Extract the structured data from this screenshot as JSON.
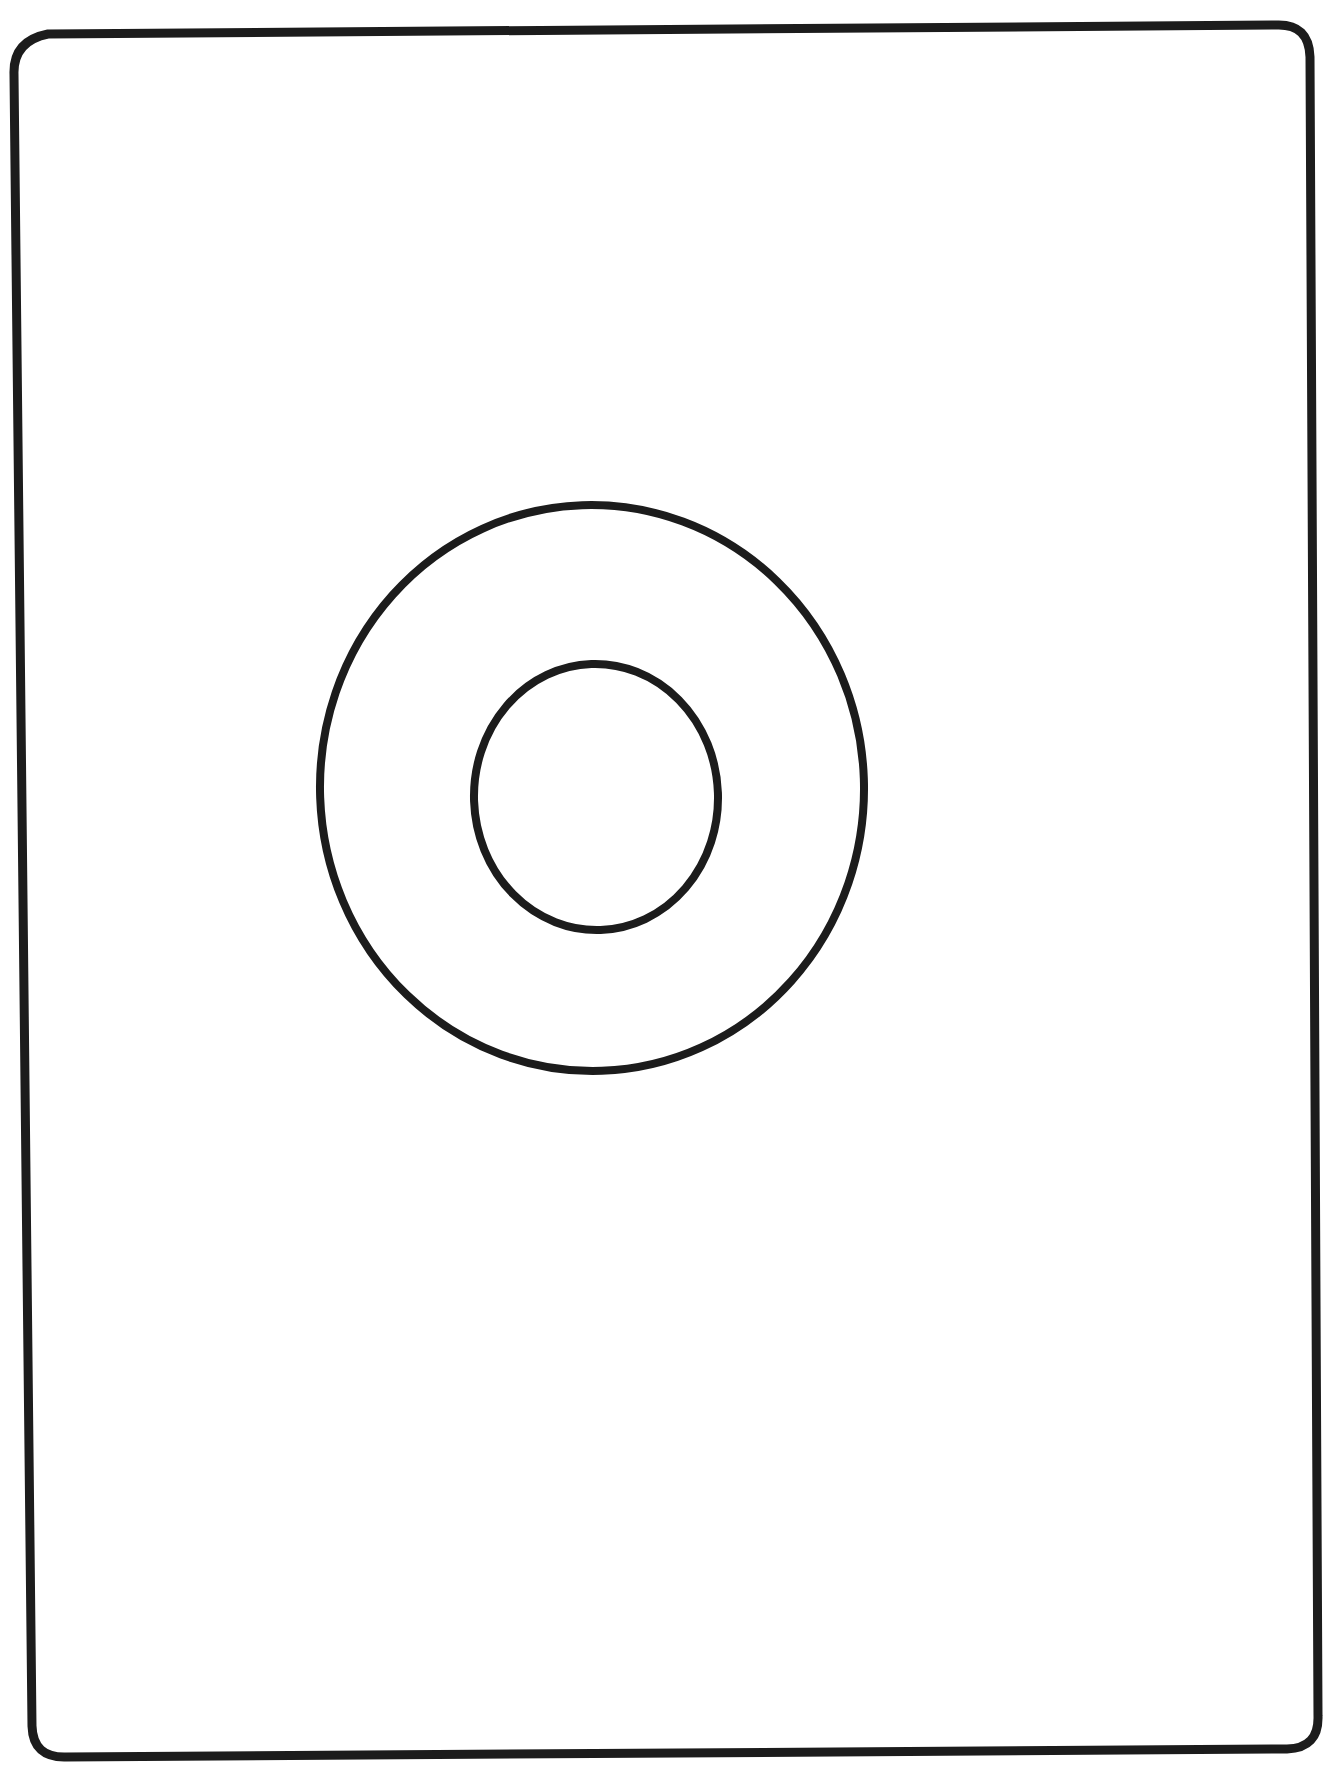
{
  "page": {
    "width": 1341,
    "height": 1768,
    "background_color": "#ffffff"
  },
  "ink": {
    "color": "#1c1c1c"
  },
  "frame": {
    "name": "rounded-rectangle-border",
    "stroke_width": 9,
    "corner_radius": 34,
    "corners": {
      "top_left": [
        14,
        40
      ],
      "top_right": [
        1307,
        27
      ],
      "bottom_right": [
        1318,
        1749
      ],
      "bottom_left": [
        31,
        1757
      ]
    },
    "path": "M 48 34 L 1277 25 Q 1309 24 1310 57 L 1318 1716 Q 1319 1748 1287 1749 L 66 1757 Q 33 1758 32 1726 L 14 74 Q 13 41 48 34 Z"
  },
  "shapes": [
    {
      "name": "outer-circle",
      "type": "ellipse",
      "center_x": 592,
      "center_y": 788,
      "radius_x": 272,
      "radius_y": 283,
      "stroke_width": 8,
      "rotation_deg": -2
    },
    {
      "name": "inner-circle",
      "type": "ellipse",
      "center_x": 596,
      "center_y": 797,
      "radius_x": 122,
      "radius_y": 133,
      "stroke_width": 8,
      "rotation_deg": -2
    }
  ],
  "chart_data": {
    "type": "diagram",
    "elements": [
      {
        "label": "frame",
        "shape": "rounded-rectangle",
        "filled": false
      },
      {
        "label": "outer circle",
        "shape": "circle",
        "filled": false,
        "diameter_px": 560
      },
      {
        "label": "inner circle",
        "shape": "circle",
        "filled": false,
        "diameter_px": 260
      }
    ],
    "annotations": [],
    "legend": []
  }
}
